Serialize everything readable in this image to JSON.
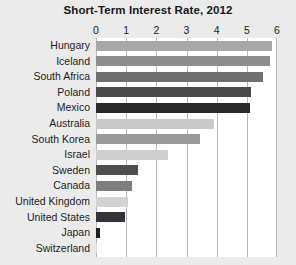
{
  "chart_data": {
    "type": "bar",
    "orientation": "horizontal",
    "title": "Short-Term Interest Rate, 2012",
    "xlabel": "",
    "ylabel": "",
    "xlim": [
      0,
      6
    ],
    "xticks": [
      0,
      1,
      2,
      3,
      4,
      5,
      6
    ],
    "xtick_labels": [
      "0",
      "1",
      "2",
      "3",
      "4",
      "5",
      "6"
    ],
    "grid": true,
    "legend": "none",
    "categories": [
      "Hungary",
      "Iceland",
      "South Africa",
      "Poland",
      "Mexico",
      "Australia",
      "South Korea",
      "Israel",
      "Sweden",
      "Canada",
      "United Kingdom",
      "United States",
      "Japan",
      "Switzerland"
    ],
    "values": [
      5.85,
      5.78,
      5.55,
      5.15,
      5.1,
      3.9,
      3.45,
      2.4,
      1.4,
      1.2,
      1.05,
      0.95,
      0.12,
      0.02
    ],
    "bar_colors": [
      "#a8a8a8",
      "#8e8e8e",
      "#6f6f6f",
      "#4a4a4a",
      "#2a2a2a",
      "#c9c9c9",
      "#9a9a9a",
      "#cfcfcf",
      "#4e4e4e",
      "#7e7e7e",
      "#d2d2d2",
      "#33333a",
      "#1d1d22",
      "#dcdcdc"
    ]
  },
  "colors": {
    "background": "#ebebeb",
    "plot_background": "#ffffff",
    "gridline": "#b9b9bd",
    "text": "#1b1b1e",
    "title": "#17171a"
  }
}
